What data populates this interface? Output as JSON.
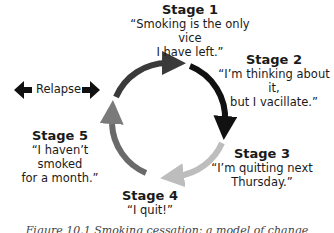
{
  "diagram": {
    "type": "cycle",
    "stages": [
      {
        "title": "Stage 1",
        "quote": "“Smoking is the only vice\nI have left.”",
        "arc_color": "#3a3a3a"
      },
      {
        "title": "Stage 2",
        "quote": "“I’m thinking about it,\nbut I vacillate.”",
        "arc_color": "#111111"
      },
      {
        "title": "Stage 3",
        "quote": "“I’m quitting next\nThursday.”",
        "arc_color": "#bdbdbd"
      },
      {
        "title": "Stage 4",
        "quote": "“I quit!”",
        "arc_color": "#6a6a6a"
      },
      {
        "title": "Stage 5",
        "quote": "“I haven’t smoked\nfor a month.”",
        "arc_color": "#7a7a7a"
      }
    ],
    "relapse": {
      "label": "Relapse",
      "icon": "double-headed-arrow-icon"
    }
  },
  "caption": "Figure 10.1 Smoking cessation: a model of change"
}
